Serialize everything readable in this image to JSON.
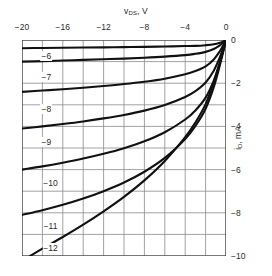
{
  "chart_data": {
    "type": "line",
    "title": "",
    "xlabel": "v_DS, V",
    "ylabel": "i_D, mA",
    "xlim": [
      -20,
      0
    ],
    "ylim": [
      -10,
      0
    ],
    "grid": true,
    "grid_step_x": 2,
    "grid_step_y": 1,
    "legend": "inline-curve-labels",
    "legend_position": "left-inside",
    "xticks": [
      -20,
      -16,
      -12,
      -8,
      -4,
      0
    ],
    "yticks": [
      0,
      -2,
      -4,
      -6,
      -8,
      -10
    ],
    "series": [
      {
        "name": "-6",
        "label": "-6",
        "points": [
          [
            -20,
            -0.38
          ],
          [
            -18,
            -0.37
          ],
          [
            -16,
            -0.36
          ],
          [
            -14,
            -0.35
          ],
          [
            -12,
            -0.34
          ],
          [
            -10,
            -0.33
          ],
          [
            -8,
            -0.32
          ],
          [
            -6,
            -0.3
          ],
          [
            -4,
            -0.28
          ],
          [
            -3,
            -0.27
          ],
          [
            -2,
            -0.24
          ],
          [
            -1.2,
            -0.2
          ],
          [
            -0.6,
            -0.13
          ],
          [
            -0.25,
            -0.06
          ],
          [
            0,
            0
          ]
        ]
      },
      {
        "name": "-7",
        "label": "-7",
        "points": [
          [
            -20,
            -1.0
          ],
          [
            -18,
            -0.98
          ],
          [
            -16,
            -0.95
          ],
          [
            -14,
            -0.92
          ],
          [
            -12,
            -0.89
          ],
          [
            -10,
            -0.86
          ],
          [
            -8,
            -0.82
          ],
          [
            -6,
            -0.77
          ],
          [
            -4,
            -0.7
          ],
          [
            -3,
            -0.64
          ],
          [
            -2,
            -0.55
          ],
          [
            -1.2,
            -0.42
          ],
          [
            -0.6,
            -0.25
          ],
          [
            -0.25,
            -0.11
          ],
          [
            0,
            0
          ]
        ]
      },
      {
        "name": "-8",
        "label": "-8",
        "points": [
          [
            -20,
            -2.4
          ],
          [
            -18,
            -2.34
          ],
          [
            -16,
            -2.28
          ],
          [
            -14,
            -2.21
          ],
          [
            -12,
            -2.13
          ],
          [
            -10,
            -2.04
          ],
          [
            -8,
            -1.93
          ],
          [
            -6,
            -1.79
          ],
          [
            -4,
            -1.59
          ],
          [
            -3,
            -1.44
          ],
          [
            -2,
            -1.22
          ],
          [
            -1.2,
            -0.9
          ],
          [
            -0.6,
            -0.52
          ],
          [
            -0.25,
            -0.23
          ],
          [
            0,
            0
          ]
        ]
      },
      {
        "name": "-9",
        "label": "-9",
        "points": [
          [
            -20,
            -4.1
          ],
          [
            -18,
            -4.0
          ],
          [
            -16,
            -3.89
          ],
          [
            -14,
            -3.77
          ],
          [
            -12,
            -3.63
          ],
          [
            -10,
            -3.47
          ],
          [
            -8,
            -3.27
          ],
          [
            -6,
            -3.01
          ],
          [
            -4,
            -2.64
          ],
          [
            -3,
            -2.37
          ],
          [
            -2,
            -1.97
          ],
          [
            -1.2,
            -1.42
          ],
          [
            -0.6,
            -0.8
          ],
          [
            -0.25,
            -0.35
          ],
          [
            0,
            0
          ]
        ]
      },
      {
        "name": "-10",
        "label": "-10",
        "points": [
          [
            -20,
            -6.0
          ],
          [
            -18,
            -5.85
          ],
          [
            -16,
            -5.68
          ],
          [
            -14,
            -5.49
          ],
          [
            -12,
            -5.27
          ],
          [
            -10,
            -5.01
          ],
          [
            -8,
            -4.69
          ],
          [
            -6,
            -4.27
          ],
          [
            -4,
            -3.68
          ],
          [
            -3,
            -3.26
          ],
          [
            -2,
            -2.67
          ],
          [
            -1.2,
            -1.88
          ],
          [
            -0.6,
            -1.03
          ],
          [
            -0.25,
            -0.45
          ],
          [
            0,
            0
          ]
        ]
      },
      {
        "name": "-11",
        "label": "-11",
        "points": [
          [
            -20,
            -8.1
          ],
          [
            -18,
            -7.88
          ],
          [
            -16,
            -7.63
          ],
          [
            -14,
            -7.34
          ],
          [
            -12,
            -7.0
          ],
          [
            -10,
            -6.6
          ],
          [
            -8,
            -6.1
          ],
          [
            -6,
            -5.46
          ],
          [
            -4,
            -4.58
          ],
          [
            -3,
            -3.98
          ],
          [
            -2,
            -3.18
          ],
          [
            -1.2,
            -2.18
          ],
          [
            -0.6,
            -1.17
          ],
          [
            -0.25,
            -0.5
          ],
          [
            0,
            0
          ]
        ]
      },
      {
        "name": "-12",
        "label": "-12",
        "points": [
          [
            -19.2,
            -10.0
          ],
          [
            -18,
            -9.66
          ],
          [
            -16,
            -9.12
          ],
          [
            -14,
            -8.55
          ],
          [
            -12,
            -7.93
          ],
          [
            -10,
            -7.26
          ],
          [
            -8,
            -6.5
          ],
          [
            -6,
            -5.6
          ],
          [
            -4,
            -4.5
          ],
          [
            -3,
            -3.82
          ],
          [
            -2,
            -2.97
          ],
          [
            -1.2,
            -1.97
          ],
          [
            -0.6,
            -1.04
          ],
          [
            -0.25,
            -0.44
          ],
          [
            0,
            0
          ]
        ]
      }
    ],
    "curve_labels": [
      {
        "text": "-6",
        "x": -17.6,
        "y": -0.72
      },
      {
        "text": "-7",
        "x": -17.6,
        "y": -1.72
      },
      {
        "text": "-8",
        "x": -17.6,
        "y": -3.2
      },
      {
        "text": "-9",
        "x": -17.6,
        "y": -4.7
      },
      {
        "text": "-10",
        "x": -17.2,
        "y": -6.62
      },
      {
        "text": "-11",
        "x": -17.2,
        "y": -8.62
      },
      {
        "text": "-12",
        "x": -17.2,
        "y": -9.62
      }
    ]
  },
  "axes": {
    "x_title_main": "v",
    "x_title_sub": "DS",
    "x_title_unit": ", V",
    "y_title_main": "i",
    "y_title_sub": "D",
    "y_title_unit": ", mA"
  },
  "colors": {
    "curve": "#111111",
    "grid": "#8a8a8a",
    "frame": "#4a4a4a",
    "text": "#2b2b2b",
    "background": "#ffffff"
  }
}
